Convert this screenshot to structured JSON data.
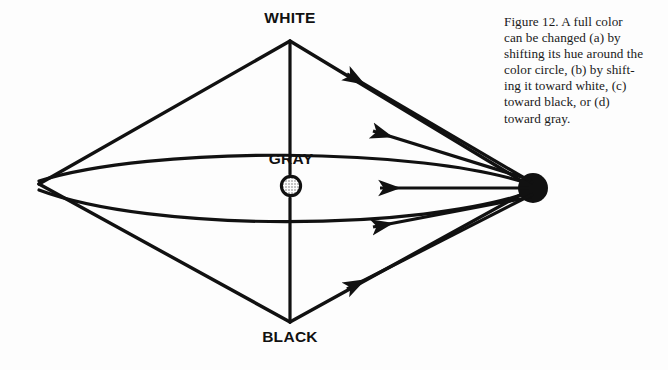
{
  "figure": {
    "labels": {
      "white": "WHITE",
      "gray": "GRAY",
      "black": "BLACK"
    },
    "caption_lines": [
      "Figure 12. A full color",
      "can be changed (a) by",
      "shifting its hue around the",
      "color circle, (b) by shift-",
      "ing it toward white, (c)",
      "toward black, or (d)",
      "toward gray."
    ],
    "caption_full": "Figure 12. A full color can be changed (a) by shifting its hue around the color circle, (b) by shifting it toward white, (c) toward black, or (d) toward gray.",
    "colors": {
      "ink": "#111111",
      "paper": "#fdfdfd",
      "stipple": "#7a7a7a"
    },
    "geometry": {
      "apex_white": [
        290,
        41
      ],
      "apex_black": [
        290,
        322
      ],
      "vertex_left": [
        39,
        184
      ],
      "full_color_dot": [
        533,
        188
      ],
      "full_color_dot_radius": 15,
      "gray_circle_center": [
        291,
        186
      ],
      "gray_circle_radius": 11
    },
    "arrows": [
      {
        "id": "a-hue-upper",
        "from": [
          533,
          188
        ],
        "to": [
          345,
          73
        ]
      },
      {
        "id": "b-toward-white",
        "from": [
          533,
          188
        ],
        "to": [
          371,
          130
        ]
      },
      {
        "id": "c-toward-gray",
        "from": [
          533,
          188
        ],
        "to": [
          378,
          188
        ]
      },
      {
        "id": "d-toward-black-upper",
        "from": [
          533,
          188
        ],
        "to": [
          371,
          228
        ]
      },
      {
        "id": "e-hue-lower",
        "from": [
          533,
          188
        ],
        "to": [
          345,
          290
        ]
      }
    ]
  }
}
